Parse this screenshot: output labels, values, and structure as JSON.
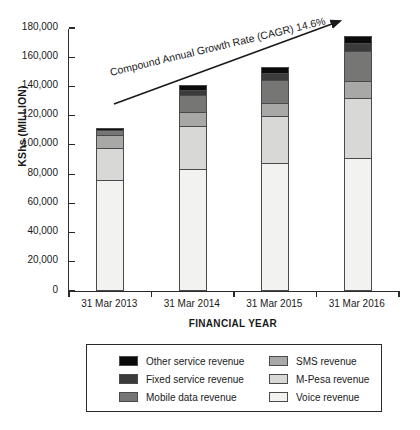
{
  "chart_data": {
    "type": "bar",
    "stacked": true,
    "title": "",
    "xlabel": "FINANCIAL YEAR",
    "ylabel": "KShs (MILLION)",
    "categories": [
      "31 Mar 2013",
      "31 Mar 2014",
      "31 Mar 2015",
      "31 Mar 2016"
    ],
    "ylim": [
      0,
      180000
    ],
    "yticks": [
      0,
      20000,
      40000,
      60000,
      80000,
      100000,
      120000,
      140000,
      160000,
      180000
    ],
    "ytick_labels": [
      "0",
      "20,000",
      "40,000",
      "60,000",
      "80,000",
      "100,000",
      "120,000",
      "140,000",
      "160,000",
      "180,000"
    ],
    "grid": false,
    "legend_position": "bottom",
    "series": [
      {
        "name": "Voice revenue",
        "color": "#f2f2f0",
        "values": [
          76000,
          83200,
          87600,
          91000
        ]
      },
      {
        "name": "M-Pesa revenue",
        "color": "#d8d8d6",
        "values": [
          21700,
          29700,
          32200,
          41000
        ]
      },
      {
        "name": "SMS revenue",
        "color": "#a8a8a6",
        "values": [
          8900,
          9600,
          8700,
          11600
        ]
      },
      {
        "name": "Mobile data revenue",
        "color": "#767674",
        "values": [
          3400,
          11600,
          15700,
          20500
        ]
      },
      {
        "name": "Fixed service revenue",
        "color": "#3b3b3b",
        "values": [
          0,
          3400,
          4800,
          5500
        ]
      },
      {
        "name": "Other service revenue",
        "color": "#0b0b0b",
        "values": [
          1400,
          3400,
          4100,
          4800
        ]
      }
    ],
    "totals": [
      111000,
      138000,
      155500,
      178000
    ],
    "annotations": [
      {
        "name": "cagr-arrow-label",
        "text": "Compound Annual Growth Rate (CAGR) 14.6%"
      }
    ]
  },
  "legend": {
    "items": [
      {
        "label": "Other service revenue",
        "color": "#0b0b0b"
      },
      {
        "label": "SMS revenue",
        "color": "#a8a8a6"
      },
      {
        "label": "Fixed service revenue",
        "color": "#3b3b3b"
      },
      {
        "label": "M-Pesa revenue",
        "color": "#d8d8d6"
      },
      {
        "label": "Mobile data revenue",
        "color": "#767674"
      },
      {
        "label": "Voice revenue",
        "color": "#f2f2f0"
      }
    ]
  }
}
